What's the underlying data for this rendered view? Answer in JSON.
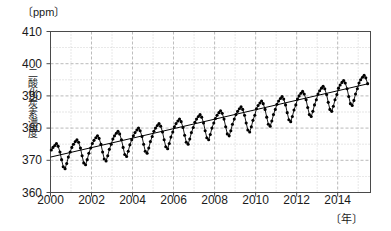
{
  "chart_data": {
    "type": "line",
    "title": "",
    "subtitle": "",
    "xlabel": "〔年〕",
    "ylabel": "二酸化炭素濃度",
    "unit_top": "〔ppm〕",
    "unit_bottom": "〔年〕",
    "ylim": [
      360,
      410
    ],
    "xlim": [
      2000,
      2015.6
    ],
    "ytick_labels": [
      "410",
      "400",
      "390",
      "380",
      "370",
      "360"
    ],
    "ytick_values": [
      410,
      400,
      390,
      380,
      370,
      360
    ],
    "xtick_labels": [
      "2000",
      "2002",
      "2004",
      "2006",
      "2008",
      "2010",
      "2012",
      "2014"
    ],
    "xtick_values": [
      2000,
      2002,
      2004,
      2006,
      2008,
      2010,
      2012,
      2014
    ],
    "grid": "dotted, major vertical every 1 year, horizontal every 5 ppm",
    "legend": "none",
    "marker": "filled circle",
    "series": [
      {
        "name": "月平均二酸化炭素濃度",
        "type": "line-with-markers",
        "color": "#000000",
        "x": [
          2000.04,
          2000.12,
          2000.21,
          2000.29,
          2000.37,
          2000.46,
          2000.54,
          2000.62,
          2000.71,
          2000.79,
          2000.87,
          2000.96,
          2001.04,
          2001.12,
          2001.21,
          2001.29,
          2001.37,
          2001.46,
          2001.54,
          2001.62,
          2001.71,
          2001.79,
          2001.87,
          2001.96,
          2002.04,
          2002.12,
          2002.21,
          2002.29,
          2002.37,
          2002.46,
          2002.54,
          2002.62,
          2002.71,
          2002.79,
          2002.87,
          2002.96,
          2003.04,
          2003.12,
          2003.21,
          2003.29,
          2003.37,
          2003.46,
          2003.54,
          2003.62,
          2003.71,
          2003.79,
          2003.87,
          2003.96,
          2004.04,
          2004.12,
          2004.21,
          2004.29,
          2004.37,
          2004.46,
          2004.54,
          2004.62,
          2004.71,
          2004.79,
          2004.87,
          2004.96,
          2005.04,
          2005.12,
          2005.21,
          2005.29,
          2005.37,
          2005.46,
          2005.54,
          2005.62,
          2005.71,
          2005.79,
          2005.87,
          2005.96,
          2006.04,
          2006.12,
          2006.21,
          2006.29,
          2006.37,
          2006.46,
          2006.54,
          2006.62,
          2006.71,
          2006.79,
          2006.87,
          2006.96,
          2007.04,
          2007.12,
          2007.21,
          2007.29,
          2007.37,
          2007.46,
          2007.54,
          2007.62,
          2007.71,
          2007.79,
          2007.87,
          2007.96,
          2008.04,
          2008.12,
          2008.21,
          2008.29,
          2008.37,
          2008.46,
          2008.54,
          2008.62,
          2008.71,
          2008.79,
          2008.87,
          2008.96,
          2009.04,
          2009.12,
          2009.21,
          2009.29,
          2009.37,
          2009.46,
          2009.54,
          2009.62,
          2009.71,
          2009.79,
          2009.87,
          2009.96,
          2010.04,
          2010.12,
          2010.21,
          2010.29,
          2010.37,
          2010.46,
          2010.54,
          2010.62,
          2010.71,
          2010.79,
          2010.87,
          2010.96,
          2011.04,
          2011.12,
          2011.21,
          2011.29,
          2011.37,
          2011.46,
          2011.54,
          2011.62,
          2011.71,
          2011.79,
          2011.87,
          2011.96,
          2012.04,
          2012.12,
          2012.21,
          2012.29,
          2012.37,
          2012.46,
          2012.54,
          2012.62,
          2012.71,
          2012.79,
          2012.87,
          2012.96,
          2013.04,
          2013.12,
          2013.21,
          2013.29,
          2013.37,
          2013.46,
          2013.54,
          2013.62,
          2013.71,
          2013.79,
          2013.87,
          2013.96,
          2014.04,
          2014.12,
          2014.21,
          2014.29,
          2014.37,
          2014.46,
          2014.54,
          2014.62,
          2014.71,
          2014.79,
          2014.87,
          2014.96,
          2015.04,
          2015.12,
          2015.21,
          2015.29,
          2015.37,
          2015.46
        ],
        "y": [
          373.2,
          374.0,
          374.6,
          375.2,
          374.4,
          372.6,
          370.2,
          368.0,
          367.4,
          369.0,
          371.0,
          372.6,
          374.0,
          375.0,
          375.8,
          376.4,
          375.6,
          373.8,
          371.4,
          369.2,
          368.6,
          370.2,
          372.2,
          373.8,
          375.2,
          376.2,
          377.0,
          377.6,
          376.8,
          375.0,
          372.6,
          370.4,
          369.8,
          371.4,
          373.4,
          375.0,
          376.6,
          377.6,
          378.4,
          379.0,
          378.2,
          376.4,
          374.0,
          371.8,
          371.2,
          372.8,
          374.8,
          376.4,
          377.6,
          378.6,
          379.4,
          380.0,
          379.2,
          377.4,
          375.0,
          372.8,
          372.2,
          373.8,
          375.8,
          377.4,
          379.0,
          380.0,
          380.8,
          381.4,
          380.6,
          378.8,
          376.4,
          374.2,
          373.6,
          375.2,
          377.2,
          378.8,
          380.4,
          381.4,
          382.2,
          382.8,
          382.0,
          380.2,
          377.8,
          375.6,
          375.0,
          376.6,
          378.6,
          380.2,
          381.8,
          382.8,
          383.6,
          384.2,
          383.4,
          381.6,
          379.2,
          377.0,
          376.4,
          378.0,
          380.0,
          381.6,
          383.0,
          384.0,
          384.8,
          385.4,
          384.6,
          382.8,
          380.4,
          378.2,
          377.6,
          379.2,
          381.2,
          382.8,
          384.2,
          385.2,
          386.0,
          386.6,
          385.8,
          384.0,
          381.6,
          379.4,
          378.8,
          380.4,
          382.4,
          384.0,
          386.0,
          387.0,
          387.8,
          388.4,
          387.6,
          385.8,
          383.4,
          381.2,
          380.6,
          382.2,
          384.2,
          385.8,
          387.4,
          388.4,
          389.2,
          389.8,
          389.0,
          387.2,
          384.8,
          382.6,
          382.0,
          383.6,
          385.6,
          387.2,
          389.0,
          390.0,
          390.8,
          391.4,
          390.6,
          388.8,
          386.4,
          384.2,
          383.6,
          385.2,
          387.2,
          388.8,
          390.6,
          391.6,
          392.4,
          393.0,
          392.2,
          390.4,
          388.0,
          385.8,
          385.2,
          386.8,
          388.8,
          390.4,
          392.4,
          393.4,
          394.2,
          394.8,
          394.0,
          392.2,
          389.8,
          387.6,
          387.0,
          388.6,
          390.6,
          392.2,
          394.0,
          395.0,
          395.8,
          396.4,
          395.6,
          393.8
        ]
      },
      {
        "name": "トレンド(回帰直線)",
        "type": "line",
        "color": "#000000",
        "x": [
          2000.0,
          2015.5
        ],
        "y": [
          371.0,
          393.8
        ]
      }
    ]
  },
  "axes": {
    "unit_top": "〔ppm〕",
    "unit_bottom": "〔年〕",
    "ylabel": "二酸化炭素濃度",
    "yticks": [
      "410",
      "400",
      "390",
      "380",
      "370",
      "360"
    ],
    "xticks": [
      "2000",
      "2002",
      "2004",
      "2006",
      "2008",
      "2010",
      "2012",
      "2014"
    ]
  },
  "colors": {
    "axis": "#4a4a4a",
    "grid": "#9a9a9a",
    "data": "#000000",
    "background": "#ffffff"
  }
}
